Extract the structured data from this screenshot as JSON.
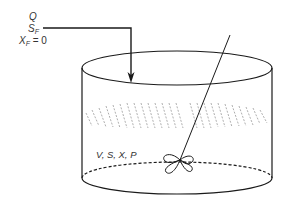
{
  "feed": {
    "flow_label": "Q",
    "substrate_label": "S",
    "substrate_sub": "F",
    "biomass_label": "X",
    "biomass_sub": "F",
    "biomass_value": " = 0"
  },
  "vessel": {
    "contents_label": "V, S, X, P"
  },
  "colors": {
    "stroke": "#1a1a1a",
    "hatch": "#9a9a9a",
    "text": "#333333"
  }
}
